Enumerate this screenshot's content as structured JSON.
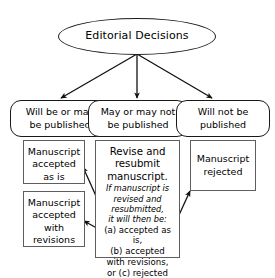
{
  "diagram": {
    "title_node": {
      "label": "Editorial Decisions"
    },
    "outcome_nodes": [
      {
        "id": "will-be-or-may-be-published",
        "line1": "Will be or may",
        "line2": "be published"
      },
      {
        "id": "may-or-may-not-be-published",
        "line1": "May or may not",
        "line2": "be published"
      },
      {
        "id": "will-not-be-published",
        "line1": "Will not be",
        "line2": "published"
      }
    ],
    "result_boxes": {
      "accepted_as_is": {
        "line1": "Manuscript",
        "line2": "accepted",
        "line3": "as is"
      },
      "accepted_with_revisions": {
        "line1": "Manuscript",
        "line2": "accepted",
        "line3": "with",
        "line4": "revisions"
      },
      "rejected": {
        "line1": "Manuscript",
        "line2": "rejected"
      },
      "revise_and_resubmit": {
        "head1": "Revise and",
        "head2": "resubmit",
        "head3": "manuscript.",
        "italic1": "If manuscript is",
        "italic2": "revised and",
        "italic3": "resubmitted,",
        "italic4": "it will then be:",
        "plain1": "(a) accepted as is,",
        "plain2": "(b) accepted",
        "plain3": "with revisions,",
        "plain4": "or (c) rejected"
      }
    },
    "colors": {
      "background": "#ffffff",
      "text": "#000000",
      "ellipse_stroke": "#1a1a1a",
      "rounded_stroke": "#1a1a1a",
      "rect_stroke": "#5e5e5e",
      "arrow_stroke": "#111111"
    }
  }
}
